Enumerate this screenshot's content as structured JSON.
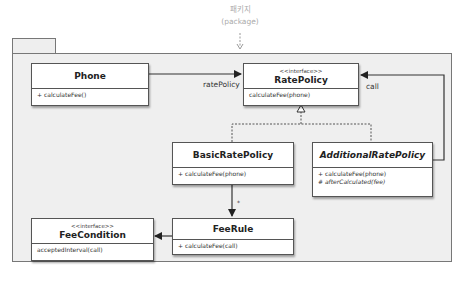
{
  "package_annotation": {
    "label_ko": "패키지",
    "label_en": "(package)"
  },
  "classes": {
    "phone": {
      "name": "Phone",
      "methods": [
        "+ calculateFee()"
      ]
    },
    "rate_policy": {
      "stereotype": "<<interface>>",
      "name": "RatePolicy",
      "methods": [
        "calculateFee(phone)"
      ]
    },
    "basic_rate_policy": {
      "name": "BasicRatePolicy",
      "methods": [
        "+ calculateFee(phone)"
      ]
    },
    "additional_rate_policy": {
      "name": "AdditionalRatePolicy",
      "methods": [
        "+ calculateFee(phone)",
        "# afterCalculated(fee)"
      ]
    },
    "fee_condition": {
      "stereotype": "<<interface>>",
      "name": "FeeCondition",
      "methods": [
        "acceptedInterval(call)"
      ]
    },
    "fee_rule": {
      "name": "FeeRule",
      "methods": [
        "+ calculateFee(call)"
      ]
    }
  },
  "relations": {
    "phone_to_rate_policy_role": "ratePolicy",
    "additional_to_rate_policy_role": "call",
    "basic_to_fee_rule_multiplicity": "*"
  }
}
